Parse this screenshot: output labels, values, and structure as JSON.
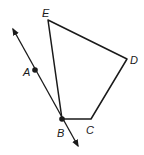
{
  "diagram": {
    "type": "geometry",
    "colors": {
      "stroke": "#1a1a1a",
      "background": "#ffffff"
    },
    "points": {
      "A": {
        "label": "A",
        "x": 35,
        "y": 70
      },
      "B": {
        "label": "B",
        "x": 62,
        "y": 119
      },
      "C": {
        "label": "C",
        "x": 91,
        "y": 119
      },
      "D": {
        "label": "D",
        "x": 127,
        "y": 59
      },
      "E": {
        "label": "E",
        "x": 48,
        "y": 20
      }
    },
    "polygon": [
      "E",
      "D",
      "C",
      "B"
    ],
    "line": {
      "through": [
        "A",
        "B"
      ],
      "arrows": "both"
    }
  }
}
